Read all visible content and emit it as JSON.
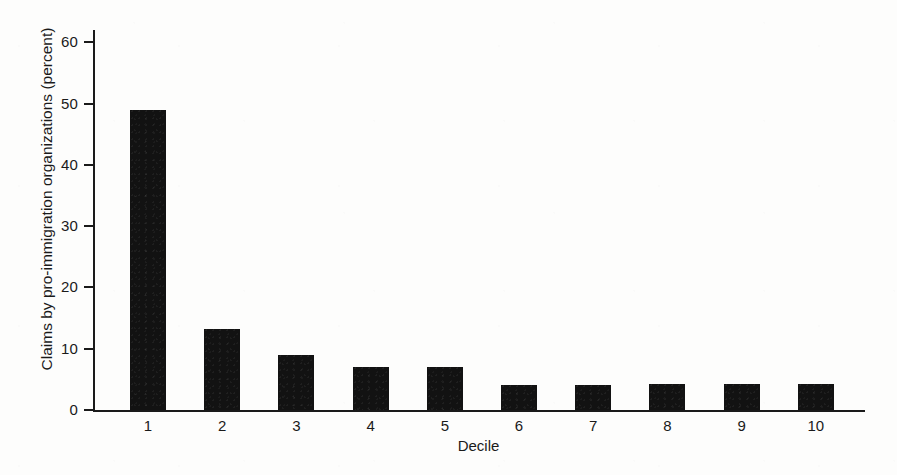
{
  "chart_data": {
    "type": "bar",
    "title": "",
    "subtitle": "",
    "xlabel": "Decile",
    "ylabel": "Claims by pro-immigration organizations (percent)",
    "categories": [
      "1",
      "2",
      "3",
      "4",
      "5",
      "6",
      "7",
      "8",
      "9",
      "10"
    ],
    "values": [
      49,
      13.2,
      9,
      7,
      7,
      4,
      4.1,
      4.2,
      4.3,
      4.3
    ],
    "ylim": [
      0,
      62
    ],
    "xlim": [
      0,
      11
    ],
    "yticks": [
      0,
      10,
      20,
      30,
      40,
      50,
      60
    ],
    "ytick_labels": [
      "0",
      "10",
      "20",
      "30",
      "40",
      "50",
      "60"
    ],
    "xtick_labels": [
      "1",
      "2",
      "3",
      "4",
      "5",
      "6",
      "7",
      "8",
      "9",
      "10"
    ],
    "grid": false,
    "legend": null,
    "legend_position": "none",
    "bar_color": "#121212",
    "axis_color": "#1a1a1a",
    "background_color": "#fdfdfc",
    "annotations": []
  }
}
